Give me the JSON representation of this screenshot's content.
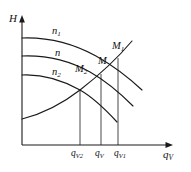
{
  "figure": {
    "type": "line-diagram",
    "title": "",
    "background_color": "#ffffff",
    "line_color": "#1a1a1a"
  },
  "axes": {
    "y_axis": {
      "label": "H",
      "name": "head",
      "arrow": "up",
      "origin_px": [
        22,
        145
      ],
      "end_px": [
        22,
        18
      ]
    },
    "x_axis": {
      "label_main": "q",
      "label_sub": "V",
      "name": "volumetric-flow-rate",
      "arrow": "right",
      "origin_px": [
        22,
        145
      ],
      "end_px": [
        172,
        145
      ]
    }
  },
  "curves": [
    {
      "id": "n1",
      "label_main": "n",
      "label_sub": "1",
      "kind": "pump-characteristic",
      "label_pos_px": [
        52,
        28
      ],
      "path": "M 22,38 C 48,37 74,44 96,56 C 112,65 128,77 142,90"
    },
    {
      "id": "n",
      "label_main": "n",
      "label_sub": "",
      "kind": "pump-characteristic",
      "label_pos_px": [
        54,
        50
      ],
      "path": "M 22,56 C 46,55 70,61 90,72 C 106,81 120,93 133,106"
    },
    {
      "id": "n2",
      "label_main": "n",
      "label_sub": "2",
      "kind": "pump-characteristic",
      "label_pos_px": [
        52,
        70
      ],
      "path": "M 22,75 C 42,74 62,80 80,90 C 94,98 106,110 117,122"
    },
    {
      "id": "system",
      "label_main": "",
      "label_sub": "",
      "kind": "system-resistance",
      "path": "M 22,119 C 42,114 62,104 80,90 C 98,76 116,60 132,41"
    }
  ],
  "points": [
    {
      "id": "M2",
      "label_main": "M",
      "label_sub": "2",
      "label_pos_px": [
        76,
        66
      ],
      "marker_px": [
        80,
        90
      ]
    },
    {
      "id": "M",
      "label_main": "M",
      "label_sub": "",
      "label_pos_px": [
        98,
        58
      ],
      "marker_px": [
        101,
        74
      ]
    },
    {
      "id": "M1",
      "label_main": "M",
      "label_sub": "1",
      "label_pos_px": [
        113,
        43
      ],
      "marker_px": [
        118,
        58
      ]
    }
  ],
  "drop_lines": [
    {
      "id": "drop-qv2",
      "x_px": 80,
      "y_top_px": 90,
      "y_bottom_px": 145
    },
    {
      "id": "drop-qv",
      "x_px": 101,
      "y_top_px": 74,
      "y_bottom_px": 145
    },
    {
      "id": "drop-qv1",
      "x_px": 118,
      "y_top_px": 58,
      "y_bottom_px": 145
    }
  ],
  "tick_labels": [
    {
      "id": "qV2",
      "label_main": "q",
      "label_sub": "V2",
      "pos_px": [
        71,
        149
      ]
    },
    {
      "id": "qV",
      "label_main": "q",
      "label_sub": "V",
      "pos_px": [
        95,
        149
      ]
    },
    {
      "id": "qV1",
      "label_main": "q",
      "label_sub": "V1",
      "pos_px": [
        113,
        149
      ]
    }
  ]
}
